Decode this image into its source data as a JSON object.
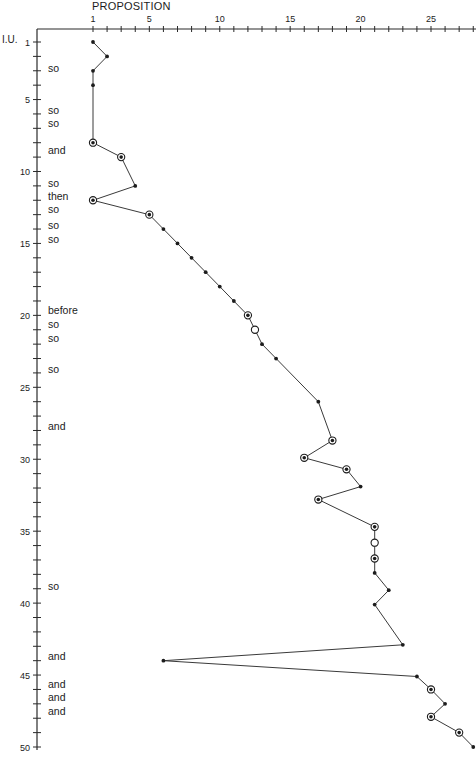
{
  "chart_data": {
    "type": "line",
    "title": "PROPOSITION",
    "xlabel": "PROPOSITION",
    "ylabel": "I.U.",
    "orientation": "x-top, y-down (inverted)",
    "xlim": [
      1,
      28
    ],
    "ylim": [
      1,
      50
    ],
    "x_tick_labels": [
      "1",
      "5",
      "10",
      "15",
      "20",
      "25"
    ],
    "y_tick_labels": [
      "1",
      "5",
      "10",
      "15",
      "20",
      "25",
      "30",
      "35",
      "40",
      "45",
      "50"
    ],
    "grid": false,
    "legend": null,
    "marker_legend": {
      "dot": "plain data point",
      "circled_dot": "circled data point",
      "open_circle": "open circle data point"
    },
    "points": [
      {
        "iu": 1,
        "prop": 1,
        "marker": "dot"
      },
      {
        "iu": 2,
        "prop": 2,
        "marker": "dot"
      },
      {
        "iu": 3,
        "prop": 1,
        "marker": "dot"
      },
      {
        "iu": 4,
        "prop": 1,
        "marker": "dot"
      },
      {
        "iu": 8,
        "prop": 1,
        "marker": "circled_dot"
      },
      {
        "iu": 9,
        "prop": 3,
        "marker": "circled_dot"
      },
      {
        "iu": 11,
        "prop": 4,
        "marker": "dot"
      },
      {
        "iu": 12,
        "prop": 1,
        "marker": "circled_dot"
      },
      {
        "iu": 13,
        "prop": 5,
        "marker": "circled_dot"
      },
      {
        "iu": 14,
        "prop": 6,
        "marker": "dot"
      },
      {
        "iu": 15,
        "prop": 7,
        "marker": "dot"
      },
      {
        "iu": 16,
        "prop": 8,
        "marker": "dot"
      },
      {
        "iu": 17,
        "prop": 9,
        "marker": "dot"
      },
      {
        "iu": 18,
        "prop": 10,
        "marker": "dot"
      },
      {
        "iu": 19,
        "prop": 11,
        "marker": "dot"
      },
      {
        "iu": 20,
        "prop": 12,
        "marker": "circled_dot"
      },
      {
        "iu": 21,
        "prop": 12.5,
        "marker": "open_circle"
      },
      {
        "iu": 22,
        "prop": 13,
        "marker": "dot"
      },
      {
        "iu": 23,
        "prop": 14,
        "marker": "dot"
      },
      {
        "iu": 26,
        "prop": 17,
        "marker": "dot"
      },
      {
        "iu": 28.7,
        "prop": 18,
        "marker": "circled_dot"
      },
      {
        "iu": 29.9,
        "prop": 16,
        "marker": "circled_dot"
      },
      {
        "iu": 30.7,
        "prop": 19,
        "marker": "circled_dot"
      },
      {
        "iu": 31.9,
        "prop": 20,
        "marker": "dot"
      },
      {
        "iu": 32.8,
        "prop": 17,
        "marker": "circled_dot"
      },
      {
        "iu": 34.7,
        "prop": 21,
        "marker": "circled_dot"
      },
      {
        "iu": 35.8,
        "prop": 21,
        "marker": "open_circle"
      },
      {
        "iu": 36.9,
        "prop": 21,
        "marker": "circled_dot"
      },
      {
        "iu": 37.9,
        "prop": 21,
        "marker": "dot"
      },
      {
        "iu": 39.1,
        "prop": 22,
        "marker": "dot"
      },
      {
        "iu": 40.1,
        "prop": 21,
        "marker": "dot"
      },
      {
        "iu": 42.9,
        "prop": 23,
        "marker": "dot"
      },
      {
        "iu": 44,
        "prop": 6,
        "marker": "dot"
      },
      {
        "iu": 45.1,
        "prop": 24,
        "marker": "dot"
      },
      {
        "iu": 46,
        "prop": 25,
        "marker": "circled_dot"
      },
      {
        "iu": 47,
        "prop": 26,
        "marker": "dot"
      },
      {
        "iu": 47.9,
        "prop": 25,
        "marker": "circled_dot"
      },
      {
        "iu": 49,
        "prop": 27,
        "marker": "circled_dot"
      },
      {
        "iu": 50,
        "prop": 28,
        "marker": "dot"
      }
    ],
    "annotations": [
      {
        "iu": 2.8,
        "text": "so"
      },
      {
        "iu": 5.7,
        "text": "so"
      },
      {
        "iu": 6.6,
        "text": "so"
      },
      {
        "iu": 8.5,
        "text": "and"
      },
      {
        "iu": 10.8,
        "text": "so"
      },
      {
        "iu": 11.7,
        "text": "then"
      },
      {
        "iu": 12.6,
        "text": "so"
      },
      {
        "iu": 13.7,
        "text": "so"
      },
      {
        "iu": 14.7,
        "text": "so"
      },
      {
        "iu": 19.6,
        "text": "before"
      },
      {
        "iu": 20.6,
        "text": "so"
      },
      {
        "iu": 21.6,
        "text": "so"
      },
      {
        "iu": 23.7,
        "text": "so"
      },
      {
        "iu": 27.7,
        "text": "and"
      },
      {
        "iu": 38.8,
        "text": "so"
      },
      {
        "iu": 43.7,
        "text": "and"
      },
      {
        "iu": 45.6,
        "text": "and"
      },
      {
        "iu": 46.5,
        "text": "and"
      },
      {
        "iu": 47.5,
        "text": "and"
      }
    ]
  },
  "labels": {
    "title": "PROPOSITION",
    "y_axis_title": "I.U."
  },
  "colors": {
    "ink": "#1c1c1c",
    "line": "#3a3a3a",
    "axis": "#2a2a2a",
    "background": "#ffffff"
  }
}
